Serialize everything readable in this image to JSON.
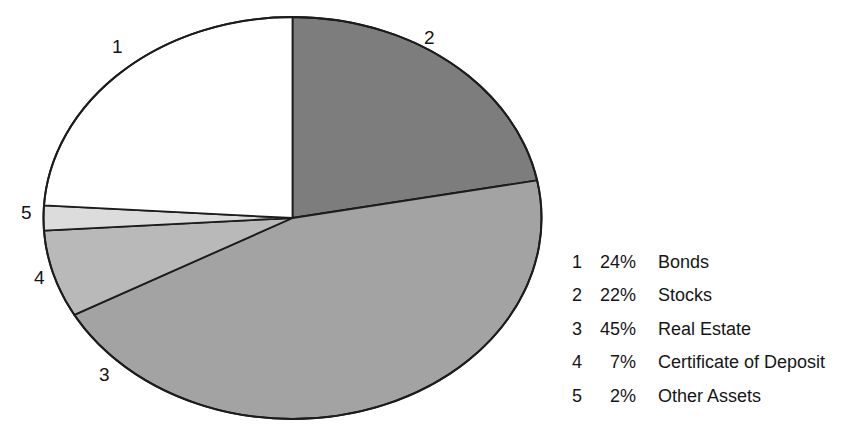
{
  "chart_data": {
    "type": "pie",
    "title": "",
    "categories": [
      "Bonds",
      "Stocks",
      "Real Estate",
      "Certificate of Deposit",
      "Other Assets"
    ],
    "values": [
      24,
      22,
      45,
      7,
      2
    ],
    "value_unit": "%",
    "legend_position": "right",
    "grid": false,
    "slices": [
      {
        "number": "1",
        "percent": "24%",
        "label": "Bonds",
        "value": 24,
        "color": "#ffffff"
      },
      {
        "number": "2",
        "percent": "22%",
        "label": "Stocks",
        "value": 22,
        "color": "#7d7d7d"
      },
      {
        "number": "3",
        "percent": "45%",
        "label": "Real Estate",
        "value": 45,
        "color": "#a3a3a3"
      },
      {
        "number": "4",
        "percent": "7%",
        "label": "Certificate of Deposit",
        "value": 7,
        "color": "#b9b9b9"
      },
      {
        "number": "5",
        "percent": "2%",
        "label": "Other Assets",
        "value": 2,
        "color": "#dcdcdc"
      }
    ],
    "stroke_color": "#1c1c1c"
  },
  "pie": {
    "callout_1": "1",
    "callout_2": "2",
    "callout_3": "3",
    "callout_4": "4",
    "callout_5": "5"
  },
  "legend": {
    "rows": [
      {
        "number": "1",
        "percent": "24%",
        "label": "Bonds"
      },
      {
        "number": "2",
        "percent": "22%",
        "label": "Stocks"
      },
      {
        "number": "3",
        "percent": "45%",
        "label": "Real Estate"
      },
      {
        "number": "4",
        "percent": "7%",
        "label": "Certificate of Deposit"
      },
      {
        "number": "5",
        "percent": "2%",
        "label": "Other Assets"
      }
    ]
  }
}
